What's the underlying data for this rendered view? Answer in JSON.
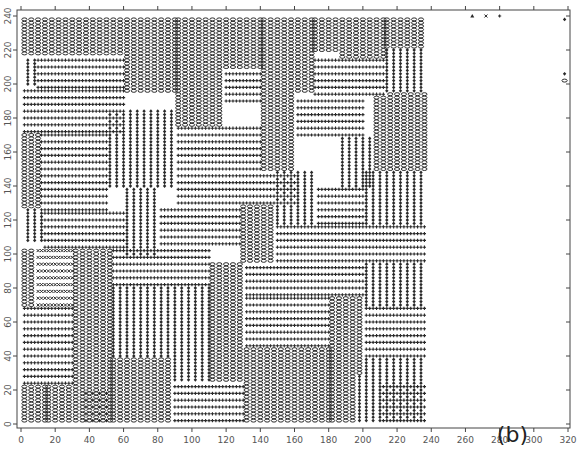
{
  "chart_data": {
    "type": "scatter",
    "title": "",
    "panel_label": "(b)",
    "xlabel": "",
    "ylabel": "",
    "xlim": [
      0,
      320
    ],
    "ylim": [
      0,
      240
    ],
    "x_ticks": [
      0,
      20,
      40,
      60,
      80,
      100,
      120,
      140,
      160,
      180,
      200,
      220,
      240,
      260,
      280,
      300,
      320
    ],
    "y_ticks": [
      0,
      20,
      40,
      60,
      80,
      100,
      120,
      140,
      160,
      180,
      200,
      220,
      240
    ],
    "grid": false,
    "legend": null,
    "symbols": {
      "o": "circle (vertical stripe domains)",
      "+": "plus (horizontal stripe domains)",
      "d": "filled diamond (vertical stripe domains)",
      "x": "cross (defect sites)",
      "t": "triangle (defect sites)"
    },
    "lattice_step": 2,
    "domains": [
      {
        "sym": "o",
        "dir": "v",
        "x": [
          2,
          60
        ],
        "y": [
          218,
          238
        ]
      },
      {
        "sym": "o",
        "dir": "v",
        "x": [
          62,
          90
        ],
        "y": [
          196,
          238
        ]
      },
      {
        "sym": "o",
        "dir": "v",
        "x": [
          92,
          118
        ],
        "y": [
          176,
          238
        ]
      },
      {
        "sym": "o",
        "dir": "v",
        "x": [
          120,
          140
        ],
        "y": [
          210,
          238
        ]
      },
      {
        "sym": "o",
        "dir": "v",
        "x": [
          142,
          170
        ],
        "y": [
          196,
          238
        ]
      },
      {
        "sym": "o",
        "dir": "v",
        "x": [
          172,
          186
        ],
        "y": [
          220,
          238
        ]
      },
      {
        "sym": "o",
        "dir": "v",
        "x": [
          188,
          212
        ],
        "y": [
          216,
          238
        ]
      },
      {
        "sym": "o",
        "dir": "v",
        "x": [
          214,
          236
        ],
        "y": [
          222,
          238
        ]
      },
      {
        "sym": "d",
        "dir": "v",
        "x": [
          4,
          8
        ],
        "y": [
          200,
          214
        ]
      },
      {
        "sym": "+",
        "dir": "h",
        "x": [
          10,
          60
        ],
        "y": [
          198,
          214
        ]
      },
      {
        "sym": "+",
        "dir": "h",
        "x": [
          2,
          60
        ],
        "y": [
          172,
          196
        ]
      },
      {
        "sym": "+",
        "dir": "h",
        "x": [
          120,
          140
        ],
        "y": [
          190,
          208
        ]
      },
      {
        "sym": "+",
        "dir": "h",
        "x": [
          172,
          212
        ],
        "y": [
          194,
          214
        ]
      },
      {
        "sym": "d",
        "dir": "v",
        "x": [
          214,
          236
        ],
        "y": [
          196,
          220
        ]
      },
      {
        "sym": "o",
        "dir": "v",
        "x": [
          2,
          10
        ],
        "y": [
          128,
          170
        ]
      },
      {
        "sym": "+",
        "dir": "h",
        "x": [
          12,
          50
        ],
        "y": [
          150,
          170
        ]
      },
      {
        "sym": "d",
        "dir": "v",
        "x": [
          52,
          90
        ],
        "y": [
          140,
          184
        ]
      },
      {
        "sym": "+",
        "dir": "h",
        "x": [
          92,
          140
        ],
        "y": [
          150,
          174
        ]
      },
      {
        "sym": "o",
        "dir": "v",
        "x": [
          142,
          160
        ],
        "y": [
          150,
          194
        ]
      },
      {
        "sym": "+",
        "dir": "h",
        "x": [
          162,
          200
        ],
        "y": [
          170,
          192
        ]
      },
      {
        "sym": "d",
        "dir": "v",
        "x": [
          188,
          206
        ],
        "y": [
          140,
          168
        ]
      },
      {
        "sym": "o",
        "dir": "v",
        "x": [
          208,
          236
        ],
        "y": [
          150,
          194
        ]
      },
      {
        "sym": "+",
        "dir": "h",
        "x": [
          12,
          50
        ],
        "y": [
          126,
          148
        ]
      },
      {
        "sym": "+",
        "dir": "h",
        "x": [
          92,
          160
        ],
        "y": [
          130,
          148
        ]
      },
      {
        "sym": "d",
        "dir": "v",
        "x": [
          150,
          172
        ],
        "y": [
          118,
          148
        ]
      },
      {
        "sym": "+",
        "dir": "h",
        "x": [
          174,
          200
        ],
        "y": [
          118,
          138
        ]
      },
      {
        "sym": "d",
        "dir": "v",
        "x": [
          202,
          236
        ],
        "y": [
          118,
          148
        ]
      },
      {
        "sym": "d",
        "dir": "v",
        "x": [
          4,
          12
        ],
        "y": [
          108,
          126
        ]
      },
      {
        "sym": "+",
        "dir": "h",
        "x": [
          14,
          60
        ],
        "y": [
          104,
          124
        ]
      },
      {
        "sym": "d",
        "dir": "v",
        "x": [
          62,
          80
        ],
        "y": [
          100,
          138
        ]
      },
      {
        "sym": "+",
        "dir": "h",
        "x": [
          82,
          128
        ],
        "y": [
          106,
          128
        ]
      },
      {
        "sym": "o",
        "dir": "v",
        "x": [
          130,
          148
        ],
        "y": [
          96,
          128
        ]
      },
      {
        "sym": "+",
        "dir": "h",
        "x": [
          150,
          200
        ],
        "y": [
          96,
          116
        ]
      },
      {
        "sym": "+",
        "dir": "h",
        "x": [
          202,
          236
        ],
        "y": [
          96,
          116
        ]
      },
      {
        "sym": "o",
        "dir": "v",
        "x": [
          2,
          8
        ],
        "y": [
          70,
          102
        ]
      },
      {
        "sym": "x",
        "dir": "h",
        "x": [
          10,
          30
        ],
        "y": [
          70,
          102
        ]
      },
      {
        "sym": "o",
        "dir": "v",
        "x": [
          32,
          52
        ],
        "y": [
          66,
          102
        ]
      },
      {
        "sym": "+",
        "dir": "h",
        "x": [
          54,
          110
        ],
        "y": [
          82,
          104
        ]
      },
      {
        "sym": "o",
        "dir": "v",
        "x": [
          112,
          130
        ],
        "y": [
          62,
          94
        ]
      },
      {
        "sym": "+",
        "dir": "h",
        "x": [
          132,
          200
        ],
        "y": [
          76,
          94
        ]
      },
      {
        "sym": "d",
        "dir": "v",
        "x": [
          202,
          236
        ],
        "y": [
          70,
          94
        ]
      },
      {
        "sym": "+",
        "dir": "h",
        "x": [
          2,
          30
        ],
        "y": [
          24,
          68
        ]
      },
      {
        "sym": "d",
        "dir": "v",
        "x": [
          54,
          110
        ],
        "y": [
          40,
          80
        ]
      },
      {
        "sym": "+",
        "dir": "h",
        "x": [
          132,
          180
        ],
        "y": [
          46,
          74
        ]
      },
      {
        "sym": "o",
        "dir": "v",
        "x": [
          182,
          200
        ],
        "y": [
          30,
          74
        ]
      },
      {
        "sym": "+",
        "dir": "h",
        "x": [
          202,
          236
        ],
        "y": [
          40,
          68
        ]
      },
      {
        "sym": "o",
        "dir": "v",
        "x": [
          32,
          52
        ],
        "y": [
          2,
          64
        ]
      },
      {
        "sym": "o",
        "dir": "v",
        "x": [
          2,
          14
        ],
        "y": [
          2,
          22
        ]
      },
      {
        "sym": "o",
        "dir": "v",
        "x": [
          16,
          30
        ],
        "y": [
          2,
          22
        ]
      },
      {
        "sym": "+",
        "dir": "h",
        "x": [
          36,
          52
        ],
        "y": [
          2,
          20
        ]
      },
      {
        "sym": "o",
        "dir": "v",
        "x": [
          54,
          88
        ],
        "y": [
          2,
          38
        ]
      },
      {
        "sym": "+",
        "dir": "h",
        "x": [
          90,
          130
        ],
        "y": [
          2,
          24
        ]
      },
      {
        "sym": "d",
        "dir": "v",
        "x": [
          90,
          110
        ],
        "y": [
          26,
          38
        ]
      },
      {
        "sym": "o",
        "dir": "v",
        "x": [
          112,
          130
        ],
        "y": [
          26,
          60
        ]
      },
      {
        "sym": "o",
        "dir": "v",
        "x": [
          132,
          180
        ],
        "y": [
          2,
          44
        ]
      },
      {
        "sym": "o",
        "dir": "v",
        "x": [
          182,
          196
        ],
        "y": [
          2,
          28
        ]
      },
      {
        "sym": "d",
        "dir": "v",
        "x": [
          198,
          236
        ],
        "y": [
          2,
          38
        ]
      },
      {
        "sym": "+",
        "dir": "h",
        "x": [
          210,
          236
        ],
        "y": [
          2,
          24
        ]
      }
    ],
    "border_symbols": [
      {
        "sym": "t",
        "x": 264,
        "y": 240
      },
      {
        "sym": "x",
        "x": 272,
        "y": 240
      },
      {
        "sym": "+",
        "x": 280,
        "y": 240
      },
      {
        "sym": "d",
        "x": 318,
        "y": 238
      },
      {
        "sym": "d",
        "x": 318,
        "y": 206
      },
      {
        "sym": "o",
        "x": 318,
        "y": 202
      }
    ]
  },
  "figure": {
    "panel_label": "(b)"
  }
}
